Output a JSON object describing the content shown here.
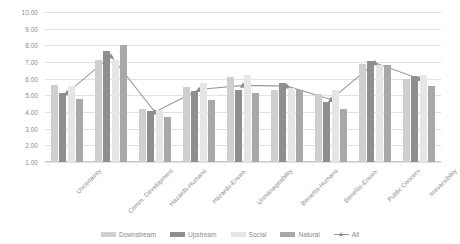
{
  "chart_data": {
    "type": "bar",
    "title": "",
    "subtitle": "",
    "xlabel": "",
    "ylabel": "",
    "ylim": [
      1.0,
      10.0
    ],
    "y_ticks": [
      "10.00",
      "9.00",
      "8.00",
      "7.00",
      "6.00",
      "5.00",
      "4.00",
      "3.00",
      "2.00",
      "1.00"
    ],
    "y_tick_values": [
      10,
      9,
      8,
      7,
      6,
      5,
      4,
      3,
      2,
      1
    ],
    "grid": true,
    "legend_position": "bottom",
    "categories": [
      "Uncertainty",
      "Comm. Development",
      "Hazards-Humans",
      "Hazards-Enviro.",
      "Unmanageability",
      "Benefits-Humans",
      "Benefits-Enviro.",
      "Public Concern",
      "Irreversibility"
    ],
    "series": [
      {
        "name": "Downstream",
        "color": "#cfcfcf",
        "type": "bar",
        "values": [
          5.6,
          7.15,
          4.2,
          5.5,
          6.1,
          5.3,
          5.1,
          6.9,
          6.0
        ]
      },
      {
        "name": "Upstream",
        "color": "#8f8f8f",
        "type": "bar",
        "values": [
          5.15,
          7.65,
          4.05,
          5.25,
          5.35,
          5.75,
          4.6,
          7.05,
          6.15
        ]
      },
      {
        "name": "Social",
        "color": "#e6e6e6",
        "type": "bar",
        "values": [
          5.55,
          7.15,
          4.15,
          5.75,
          6.2,
          5.45,
          5.35,
          6.85,
          6.25
        ]
      },
      {
        "name": "Natural",
        "color": "#a8a8a8",
        "type": "bar",
        "values": [
          4.8,
          8.05,
          3.7,
          4.75,
          5.15,
          5.35,
          4.2,
          6.8,
          5.55
        ]
      },
      {
        "name": "All",
        "color": "#9a9a9a",
        "type": "line",
        "marker": "triangle",
        "values": [
          5.15,
          7.35,
          4.0,
          5.35,
          5.6,
          5.55,
          4.75,
          6.95,
          6.0
        ]
      }
    ]
  },
  "legend": {
    "items": [
      {
        "label": "Downstream",
        "swatch": "s0"
      },
      {
        "label": "Upstream",
        "swatch": "s1"
      },
      {
        "label": "Social",
        "swatch": "s2"
      },
      {
        "label": "Natural",
        "swatch": "s3"
      },
      {
        "label": "All",
        "swatch": "line"
      }
    ]
  }
}
